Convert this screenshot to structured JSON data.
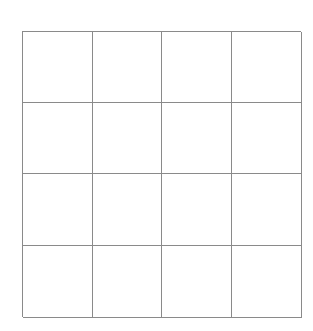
{
  "grid": {
    "rows": 4,
    "columns": 4,
    "line_color": "#8a8a8a",
    "background_color": "#ffffff",
    "cells": [
      [
        "",
        "",
        "",
        ""
      ],
      [
        "",
        "",
        "",
        ""
      ],
      [
        "",
        "",
        "",
        ""
      ],
      [
        "",
        "",
        "",
        ""
      ]
    ]
  }
}
